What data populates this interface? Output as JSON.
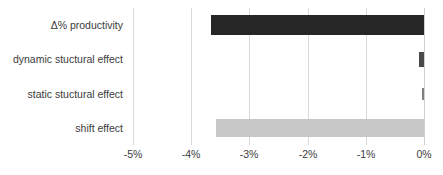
{
  "chart_data": {
    "type": "bar",
    "orientation": "horizontal",
    "title": "",
    "xlabel": "",
    "ylabel": "",
    "categories": [
      "Δ% productivity",
      "dynamic stuctural effect",
      "static stuctural effect",
      "shift effect"
    ],
    "values": [
      -3.66,
      -0.09,
      -0.03,
      -3.57
    ],
    "value_format": "percent",
    "xlim": [
      -5,
      0
    ],
    "xticks": [
      -5,
      -4,
      -3,
      -2,
      -1,
      0
    ],
    "xtick_labels": [
      "-5%",
      "-4%",
      "-3%",
      "-2%",
      "-1%",
      "0%"
    ],
    "grid": true,
    "grid_axis": "x",
    "legend": false,
    "bar_colors": [
      "#262626",
      "#4a4a4a",
      "#808080",
      "#c8c8c8"
    ],
    "bar_heights_px": [
      20,
      15,
      12,
      18
    ],
    "colors": {
      "dark_bar": "#262626",
      "medium_bar": "#4a4a4a",
      "light_bar": "#c8c8c8",
      "gridline": "#d9d9d9",
      "text": "#3b3b3b",
      "background": "#ffffff"
    }
  }
}
